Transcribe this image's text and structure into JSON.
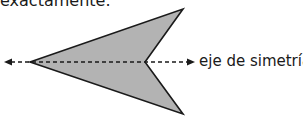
{
  "top_text": "exactamente.",
  "axis_label": "eje de simetría",
  "shape": {
    "fill": "#b3b3b3",
    "stroke": "#1a1a1a",
    "vertices": [
      [
        30,
        62
      ],
      [
        183,
        9
      ],
      [
        145,
        62
      ],
      [
        183,
        114
      ]
    ]
  },
  "axis": {
    "y": 62,
    "x_start": 5,
    "x_end": 194,
    "style": "dashed",
    "arrows": "both"
  }
}
